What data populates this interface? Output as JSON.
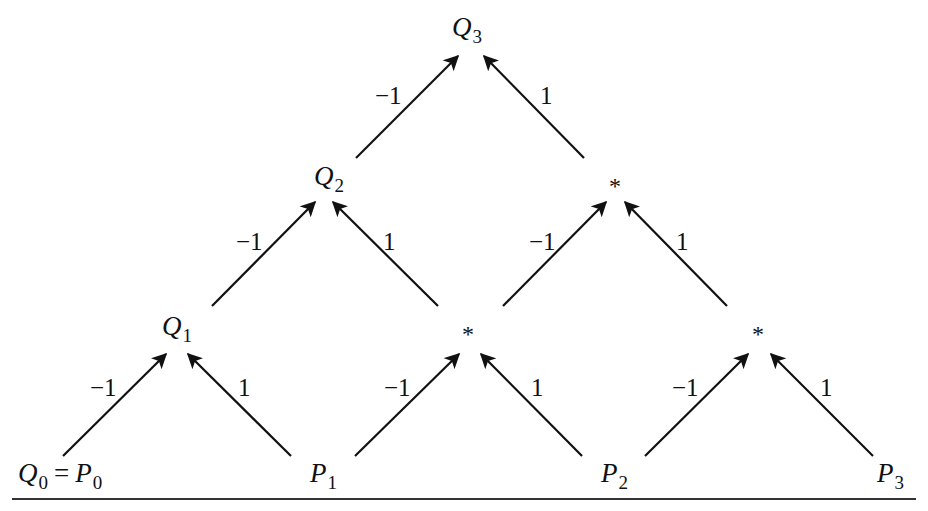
{
  "diagram": {
    "type": "tree",
    "nodes": {
      "q3": {
        "base": "Q",
        "sub": "3"
      },
      "q2": {
        "base": "Q",
        "sub": "2"
      },
      "q1": {
        "base": "Q",
        "sub": "1"
      },
      "q0": {
        "base": "Q",
        "sub": "0",
        "eq": "=",
        "base2": "P",
        "sub2": "0"
      },
      "p1": {
        "base": "P",
        "sub": "1"
      },
      "p2": {
        "base": "P",
        "sub": "2"
      },
      "p3": {
        "base": "P",
        "sub": "3"
      },
      "star_mid_right": "*",
      "star_bottom_mid": "*",
      "star_bottom_right": "*"
    },
    "edge_labels": {
      "neg": "−1",
      "pos": "1"
    },
    "edges": [
      {
        "from": "q2",
        "to": "q3",
        "weight": "-1"
      },
      {
        "from": "star_mid_right",
        "to": "q3",
        "weight": "1"
      },
      {
        "from": "q1",
        "to": "q2",
        "weight": "-1"
      },
      {
        "from": "star_bottom_mid",
        "to": "q2",
        "weight": "1"
      },
      {
        "from": "star_bottom_mid",
        "to": "star_mid_right",
        "weight": "-1"
      },
      {
        "from": "star_bottom_right",
        "to": "star_mid_right",
        "weight": "1"
      },
      {
        "from": "q0",
        "to": "q1",
        "weight": "-1"
      },
      {
        "from": "p1",
        "to": "q1",
        "weight": "1"
      },
      {
        "from": "p1",
        "to": "star_bottom_mid",
        "weight": "-1"
      },
      {
        "from": "p2",
        "to": "star_bottom_mid",
        "weight": "1"
      },
      {
        "from": "p2",
        "to": "star_bottom_right",
        "weight": "-1"
      },
      {
        "from": "p3",
        "to": "star_bottom_right",
        "weight": "1"
      }
    ],
    "colors": {
      "ink": "#111111",
      "rule": "#333333",
      "background": "#ffffff"
    }
  }
}
